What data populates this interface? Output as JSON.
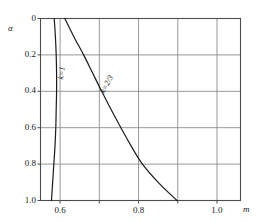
{
  "chart_data": {
    "type": "line",
    "title": "",
    "xlabel": "m",
    "ylabel": "α",
    "xlim": [
      0.55,
      1.06
    ],
    "ylim": [
      0,
      1.0
    ],
    "y_axis_inverted": true,
    "grid": true,
    "legend": "none",
    "x_ticks": [
      {
        "value": 0.6,
        "label": "0.6"
      },
      {
        "value": 0.7,
        "label": ""
      },
      {
        "value": 0.8,
        "label": "0.8"
      },
      {
        "value": 0.9,
        "label": ""
      },
      {
        "value": 1.0,
        "label": "1.0"
      }
    ],
    "y_ticks": [
      {
        "value": 0.0,
        "label": "0"
      },
      {
        "value": 0.2,
        "label": "0.2"
      },
      {
        "value": 0.4,
        "label": "0.4"
      },
      {
        "value": 0.6,
        "label": "0.6"
      },
      {
        "value": 0.8,
        "label": "0.8"
      },
      {
        "value": 1.0,
        "label": "1.0"
      }
    ],
    "series": [
      {
        "name": "k=1",
        "label": "k=1",
        "color": "#1a1a1a",
        "points": [
          {
            "m": 0.585,
            "alpha": 0.0
          },
          {
            "m": 0.588,
            "alpha": 0.1
          },
          {
            "m": 0.59,
            "alpha": 0.2
          },
          {
            "m": 0.591,
            "alpha": 0.3
          },
          {
            "m": 0.591,
            "alpha": 0.4
          },
          {
            "m": 0.59,
            "alpha": 0.5
          },
          {
            "m": 0.589,
            "alpha": 0.6
          },
          {
            "m": 0.587,
            "alpha": 0.7
          },
          {
            "m": 0.584,
            "alpha": 0.8
          },
          {
            "m": 0.581,
            "alpha": 0.9
          },
          {
            "m": 0.578,
            "alpha": 1.0
          }
        ]
      },
      {
        "name": "k=2/3",
        "label": "k=2/3",
        "color": "#1a1a1a",
        "points": [
          {
            "m": 0.612,
            "alpha": 0.0
          },
          {
            "m": 0.635,
            "alpha": 0.1
          },
          {
            "m": 0.66,
            "alpha": 0.2
          },
          {
            "m": 0.683,
            "alpha": 0.3
          },
          {
            "m": 0.706,
            "alpha": 0.4
          },
          {
            "m": 0.73,
            "alpha": 0.5
          },
          {
            "m": 0.755,
            "alpha": 0.6
          },
          {
            "m": 0.781,
            "alpha": 0.7
          },
          {
            "m": 0.81,
            "alpha": 0.8
          },
          {
            "m": 0.85,
            "alpha": 0.9
          },
          {
            "m": 0.898,
            "alpha": 1.0
          }
        ]
      }
    ],
    "annotations": [
      {
        "text": "k=1",
        "m": 0.592,
        "alpha": 0.33,
        "rotation": -82
      },
      {
        "text": "k=2/3",
        "m": 0.7,
        "alpha": 0.4,
        "rotation": -62
      }
    ]
  }
}
